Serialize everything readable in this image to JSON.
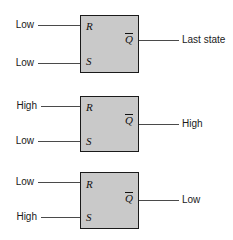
{
  "diagram": {
    "colors": {
      "block_fill": "#c9c9c9",
      "block_stroke": "#1a1a1a",
      "wire": "#4a4a4a",
      "text": "#1a1a1a",
      "background": "#ffffff"
    },
    "pin_labels": {
      "r": "R",
      "s": "S",
      "qbar": "Q"
    },
    "cases": [
      {
        "id": "case-last-state",
        "r_input": "Low",
        "s_input": "Low",
        "q_output": "Last state"
      },
      {
        "id": "case-set-high",
        "r_input": "High",
        "s_input": "Low",
        "q_output": "High"
      },
      {
        "id": "case-reset-low",
        "r_input": "Low",
        "s_input": "High",
        "q_output": "Low"
      }
    ]
  }
}
